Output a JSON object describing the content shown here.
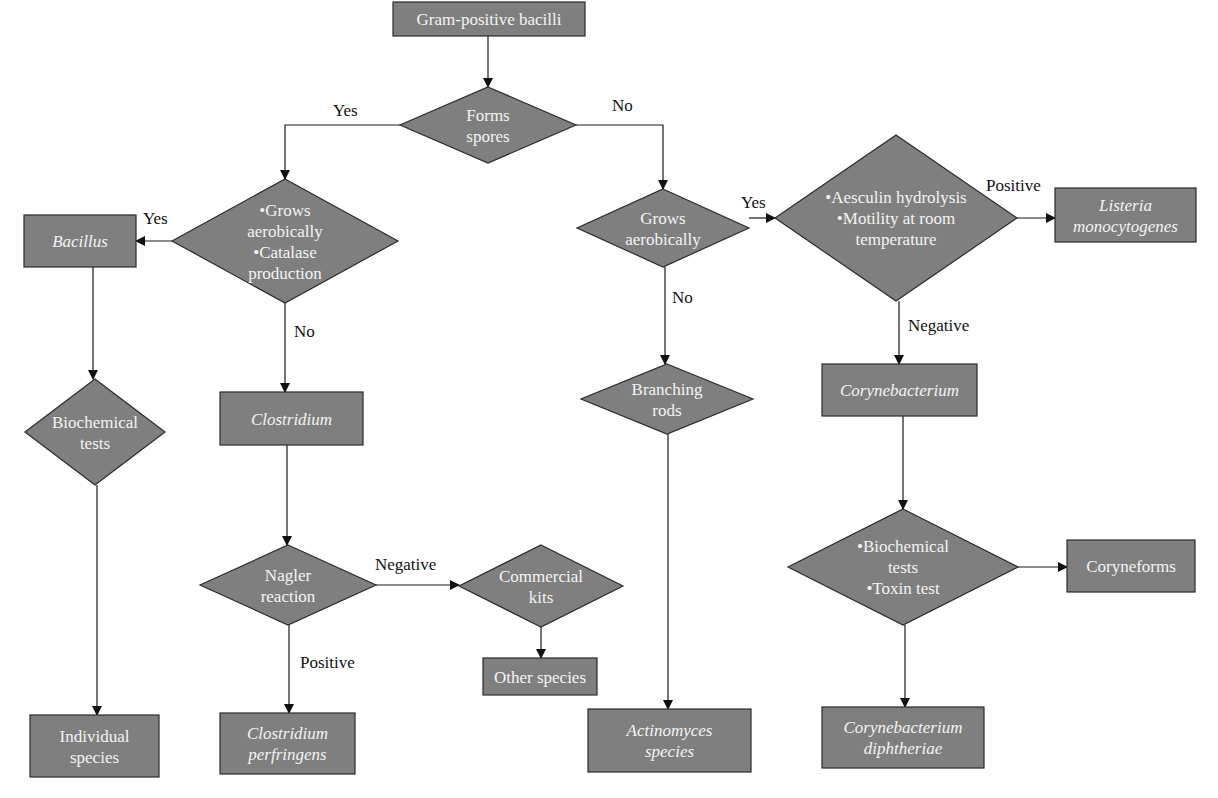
{
  "colors": {
    "node_fill": "#7f7f7f",
    "node_stroke": "#2b2b2b",
    "node_text": "#f4f4f4",
    "edge": "#1a1a1a",
    "label_text": "#111111",
    "background": "#ffffff"
  },
  "nodes": [
    {
      "id": "gram_pos",
      "type": "rect",
      "x": 393,
      "y": 2,
      "w": 192,
      "h": 34,
      "lines": [
        "Gram-positive bacilli"
      ],
      "italic": false
    },
    {
      "id": "forms_spores",
      "type": "diamond",
      "cx": 488,
      "cy": 125,
      "hw": 88,
      "hh": 38,
      "lines": [
        "Forms",
        "spores"
      ],
      "italic": false
    },
    {
      "id": "grows_catalase",
      "type": "diamond",
      "cx": 285,
      "cy": 241,
      "hw": 113,
      "hh": 62,
      "lines": [
        "•Grows",
        "aerobically",
        "•Catalase",
        "production"
      ],
      "italic": false
    },
    {
      "id": "bacillus",
      "type": "rect",
      "x": 24,
      "y": 215,
      "w": 112,
      "h": 52,
      "lines": [
        "Bacillus"
      ],
      "italic": true
    },
    {
      "id": "grows_aerobically",
      "type": "diamond",
      "cx": 663,
      "cy": 228,
      "hw": 86,
      "hh": 39,
      "lines": [
        "Grows",
        "aerobically"
      ],
      "italic": false
    },
    {
      "id": "aesculin",
      "type": "diamond",
      "cx": 896,
      "cy": 218,
      "hw": 121,
      "hh": 83,
      "lines": [
        "•Aesculin hydrolysis",
        "•Motility at room",
        "temperature"
      ],
      "italic": false
    },
    {
      "id": "listeria",
      "type": "rect",
      "x": 1055,
      "y": 188,
      "w": 141,
      "h": 54,
      "lines": [
        "Listeria",
        "monocytogenes"
      ],
      "italic": true
    },
    {
      "id": "biochem_left",
      "type": "diamond",
      "cx": 95,
      "cy": 432,
      "hw": 70,
      "hh": 53,
      "lines": [
        "Biochemical",
        "tests"
      ],
      "italic": false
    },
    {
      "id": "clostridium",
      "type": "rect",
      "x": 220,
      "y": 392,
      "w": 143,
      "h": 53,
      "lines": [
        "Clostridium"
      ],
      "italic": true
    },
    {
      "id": "branching_rods",
      "type": "diamond",
      "cx": 667,
      "cy": 399,
      "hw": 86,
      "hh": 35,
      "lines": [
        "Branching",
        "rods"
      ],
      "italic": false
    },
    {
      "id": "corynebacterium",
      "type": "rect",
      "x": 822,
      "y": 364,
      "w": 155,
      "h": 52,
      "lines": [
        "Corynebacterium"
      ],
      "italic": true
    },
    {
      "id": "nagler",
      "type": "diamond",
      "cx": 288,
      "cy": 585,
      "hw": 88,
      "hh": 40,
      "lines": [
        "Nagler",
        "reaction"
      ],
      "italic": false
    },
    {
      "id": "commercial_kits",
      "type": "diamond",
      "cx": 541,
      "cy": 586,
      "hw": 82,
      "hh": 41,
      "lines": [
        "Commercial",
        "kits"
      ],
      "italic": false
    },
    {
      "id": "biochem_toxin",
      "type": "diamond",
      "cx": 903,
      "cy": 567,
      "hw": 115,
      "hh": 58,
      "lines": [
        "•Biochemical",
        "tests",
        "•Toxin test"
      ],
      "italic": false
    },
    {
      "id": "coryneforms",
      "type": "rect",
      "x": 1067,
      "y": 540,
      "w": 128,
      "h": 52,
      "lines": [
        "Coryneforms"
      ],
      "italic": false
    },
    {
      "id": "other_species",
      "type": "rect",
      "x": 483,
      "y": 658,
      "w": 114,
      "h": 37,
      "lines": [
        "Other species"
      ],
      "italic": false
    },
    {
      "id": "individual_species",
      "type": "rect",
      "x": 30,
      "y": 715,
      "w": 129,
      "h": 62,
      "lines": [
        "Individual",
        "species"
      ],
      "italic": false
    },
    {
      "id": "c_perfringens",
      "type": "rect",
      "x": 220,
      "y": 713,
      "w": 135,
      "h": 61,
      "lines": [
        "Clostridium",
        "perfringens"
      ],
      "italic": true
    },
    {
      "id": "actinomyces",
      "type": "rect",
      "x": 588,
      "y": 709,
      "w": 163,
      "h": 63,
      "lines": [
        "Actinomyces",
        "species"
      ],
      "italic": true
    },
    {
      "id": "c_diphtheriae",
      "type": "rect",
      "x": 822,
      "y": 707,
      "w": 162,
      "h": 61,
      "lines": [
        "Corynebacterium",
        "diphtheriae"
      ],
      "italic": true
    }
  ],
  "edges": [
    {
      "from": "gram_pos",
      "to": "forms_spores",
      "points": [
        [
          488,
          36
        ],
        [
          488,
          87
        ]
      ],
      "label": ""
    },
    {
      "from": "forms_spores",
      "to": "grows_catalase",
      "points": [
        [
          400,
          125
        ],
        [
          285,
          125
        ],
        [
          285,
          179
        ]
      ],
      "label": "Yes",
      "label_x": 333,
      "label_y": 116
    },
    {
      "from": "forms_spores",
      "to": "grows_aerobically",
      "points": [
        [
          576,
          125
        ],
        [
          663,
          125
        ],
        [
          663,
          189
        ]
      ],
      "label": "No",
      "label_x": 612,
      "label_y": 111
    },
    {
      "from": "grows_catalase",
      "to": "bacillus",
      "points": [
        [
          172,
          241
        ],
        [
          136,
          241
        ]
      ],
      "label": "Yes",
      "label_x": 143,
      "label_y": 224
    },
    {
      "from": "grows_catalase",
      "to": "clostridium",
      "points": [
        [
          285,
          303
        ],
        [
          285,
          392
        ]
      ],
      "label": "No",
      "label_x": 294,
      "label_y": 337
    },
    {
      "from": "grows_aerobically",
      "to": "aesculin",
      "points": [
        [
          749,
          218
        ],
        [
          775,
          218
        ]
      ],
      "label": "Yes",
      "label_x": 741,
      "label_y": 208
    },
    {
      "from": "grows_aerobically",
      "to": "branching_rods",
      "points": [
        [
          665,
          267
        ],
        [
          665,
          364
        ]
      ],
      "label": "No",
      "label_x": 672,
      "label_y": 303
    },
    {
      "from": "aesculin",
      "to": "listeria",
      "points": [
        [
          1017,
          218
        ],
        [
          1055,
          218
        ]
      ],
      "label": "Positive",
      "label_x": 986,
      "label_y": 191
    },
    {
      "from": "aesculin",
      "to": "corynebacterium",
      "points": [
        [
          899,
          301
        ],
        [
          899,
          364
        ]
      ],
      "label": "Negative",
      "label_x": 908,
      "label_y": 331
    },
    {
      "from": "bacillus",
      "to": "biochem_left",
      "points": [
        [
          93,
          267
        ],
        [
          93,
          379
        ]
      ],
      "label": ""
    },
    {
      "from": "clostridium",
      "to": "nagler",
      "points": [
        [
          287,
          445
        ],
        [
          287,
          545
        ]
      ],
      "label": ""
    },
    {
      "from": "branching_rods",
      "to": "actinomyces",
      "points": [
        [
          668,
          434
        ],
        [
          668,
          709
        ]
      ],
      "label": ""
    },
    {
      "from": "corynebacterium",
      "to": "biochem_toxin",
      "points": [
        [
          903,
          416
        ],
        [
          903,
          509
        ]
      ],
      "label": ""
    },
    {
      "from": "nagler",
      "to": "commercial_kits",
      "points": [
        [
          376,
          585
        ],
        [
          459,
          585
        ]
      ],
      "label": "Negative",
      "label_x": 375,
      "label_y": 570
    },
    {
      "from": "nagler",
      "to": "c_perfringens",
      "points": [
        [
          289,
          625
        ],
        [
          289,
          713
        ]
      ],
      "label": "Positive",
      "label_x": 300,
      "label_y": 668
    },
    {
      "from": "commercial_kits",
      "to": "other_species",
      "points": [
        [
          541,
          627
        ],
        [
          541,
          658
        ]
      ],
      "label": ""
    },
    {
      "from": "biochem_toxin",
      "to": "coryneforms",
      "points": [
        [
          1018,
          567
        ],
        [
          1067,
          567
        ]
      ],
      "label": ""
    },
    {
      "from": "biochem_toxin",
      "to": "c_diphtheriae",
      "points": [
        [
          905,
          625
        ],
        [
          905,
          707
        ]
      ],
      "label": ""
    },
    {
      "from": "biochem_left",
      "to": "individual_species",
      "points": [
        [
          97,
          485
        ],
        [
          97,
          715
        ]
      ],
      "label": ""
    }
  ]
}
